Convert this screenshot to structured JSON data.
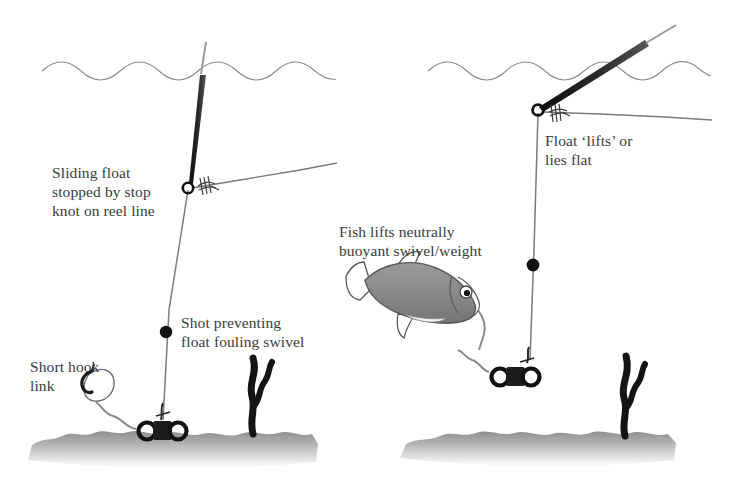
{
  "figure": {
    "width": 737,
    "height": 498,
    "background_color": "#ffffff"
  },
  "colors": {
    "ink": "#3a3a3a",
    "line": "#6e6e6e",
    "float_body": "#1d1d1d",
    "shot": "#111111",
    "weed": "#1a1a1a",
    "fish_body": "#8a8a8a",
    "fish_outline": "#4a4a4a",
    "lakebed_top": "#8d8d8d",
    "lakebed_bottom": "#ffffff",
    "water_line": "#8c8c8c",
    "swivel": "#1a1a1a",
    "bait": "#ffffff"
  },
  "panels": [
    {
      "id": "left",
      "name": "rig-at-rest",
      "labels": [
        {
          "id": "sliding-float",
          "text": "Sliding float\nstopped by stop\nknot on reel line"
        },
        {
          "id": "shot-preventing",
          "text": "Shot preventing\nfloat fouling swivel"
        },
        {
          "id": "short-hook",
          "text": "Short hook\nlink"
        }
      ],
      "elements": [
        "water-surface",
        "float-upright",
        "stop-knot",
        "reel-line",
        "main-line",
        "shot",
        "swivel-weight",
        "hook-link",
        "bait-hook",
        "weed",
        "lakebed"
      ]
    },
    {
      "id": "right",
      "name": "rig-with-fish-lifting",
      "labels": [
        {
          "id": "fish-lifts",
          "text": "Fish lifts neutrally\nbuoyant swivel/weight"
        },
        {
          "id": "float-lifts",
          "text": "Float ‘lifts’ or\nlies flat"
        }
      ],
      "elements": [
        "water-surface",
        "float-tilted",
        "stop-knot",
        "reel-line",
        "main-line",
        "shot",
        "swivel-weight",
        "fish",
        "hook-link",
        "weed",
        "lakebed"
      ]
    }
  ]
}
